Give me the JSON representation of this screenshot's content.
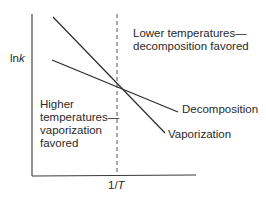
{
  "diagram": {
    "y_axis_label": {
      "prefix": "ln",
      "var": "k"
    },
    "x_axis_label": {
      "prefix": "1/",
      "var": "T"
    },
    "regions": {
      "right": {
        "lines": [
          "Lower temperatures—",
          "decomposition favored"
        ]
      },
      "left": {
        "lines": [
          "Higher",
          "temperatures—",
          "vaporization",
          "favored"
        ]
      }
    },
    "series": [
      {
        "name": "Decomposition",
        "label": "Decomposition",
        "start": [
          52,
          60
        ],
        "end": [
          178,
          112
        ]
      },
      {
        "name": "Vaporization",
        "label": "Vaporization",
        "start": [
          53,
          17
        ],
        "end": [
          165,
          133
        ]
      }
    ],
    "intersection": [
      117,
      85
    ],
    "colors": {
      "line": "#2a2a2a",
      "dashed": "#555555",
      "background": "#ffffff"
    }
  }
}
